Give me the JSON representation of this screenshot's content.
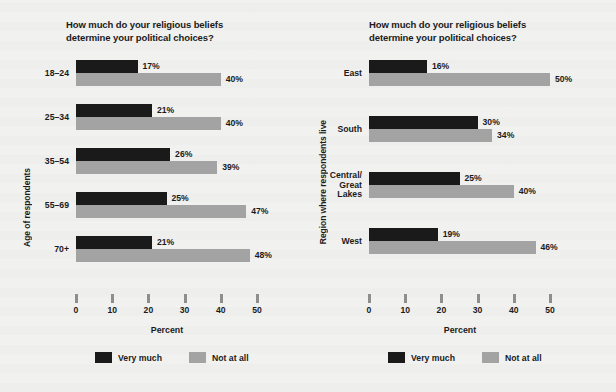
{
  "colors": {
    "background": "#f1f1f0",
    "very_much": "#1a1a1a",
    "not_at_all": "#a3a3a3",
    "tick": "#8e8e8e",
    "text": "#1b1b1b"
  },
  "chart_data": [
    {
      "type": "bar",
      "title": "How much do your religious beliefs\ndetermine your political choices?",
      "orientation": "horizontal",
      "grouped": true,
      "ylabel": "Age of respondents",
      "xlabel": "Percent",
      "xlim": [
        0,
        50
      ],
      "xticks": [
        "0",
        "10",
        "20",
        "30",
        "40",
        "50"
      ],
      "xtick_values": [
        0,
        10,
        20,
        30,
        40,
        50
      ],
      "grid": false,
      "legend_position": "bottom",
      "categories": [
        "18–24",
        "25–34",
        "35–54",
        "55–69",
        "70+"
      ],
      "series": [
        {
          "name": "Very much",
          "color": "#1a1a1a",
          "values": [
            17,
            21,
            26,
            25,
            21
          ],
          "labels": [
            "17%",
            "21%",
            "26%",
            "25%",
            "21%"
          ]
        },
        {
          "name": "Not at all",
          "color": "#a3a3a3",
          "values": [
            40,
            40,
            39,
            47,
            48
          ],
          "labels": [
            "40%",
            "40%",
            "39%",
            "47%",
            "48%"
          ]
        }
      ]
    },
    {
      "type": "bar",
      "title": "How much do your religious beliefs\ndetermine your political choices?",
      "orientation": "horizontal",
      "grouped": true,
      "ylabel": "Region where respondents live",
      "xlabel": "Percent",
      "xlim": [
        0,
        50
      ],
      "xticks": [
        "0",
        "10",
        "20",
        "30",
        "40",
        "50"
      ],
      "xtick_values": [
        0,
        10,
        20,
        30,
        40,
        50
      ],
      "grid": false,
      "legend_position": "bottom",
      "categories": [
        "East",
        "South",
        "Central/\nGreat\nLakes",
        "West"
      ],
      "series": [
        {
          "name": "Very much",
          "color": "#1a1a1a",
          "values": [
            16,
            30,
            25,
            19
          ],
          "labels": [
            "16%",
            "30%",
            "25%",
            "19%"
          ]
        },
        {
          "name": "Not at all",
          "color": "#a3a3a3",
          "values": [
            50,
            34,
            40,
            46
          ],
          "labels": [
            "50%",
            "34%",
            "40%",
            "46%"
          ]
        }
      ]
    }
  ],
  "legend": {
    "items": [
      {
        "label": "Very much",
        "color": "#1a1a1a"
      },
      {
        "label": "Not at all",
        "color": "#a3a3a3"
      }
    ]
  }
}
